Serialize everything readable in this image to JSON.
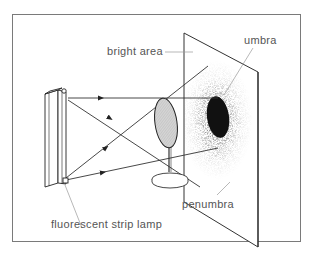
{
  "diagram": {
    "labels": {
      "bright_area": "bright area",
      "umbra": "umbra",
      "penumbra": "penumbra",
      "lamp": "fluorescent strip lamp"
    },
    "colors": {
      "background": "#ffffff",
      "frame": "#7a7a7a",
      "line": "#333333",
      "leader": "#9a9a9a",
      "umbra_fill": "#111111",
      "disc_fill": "#cfcfcf",
      "text": "#555555"
    }
  }
}
